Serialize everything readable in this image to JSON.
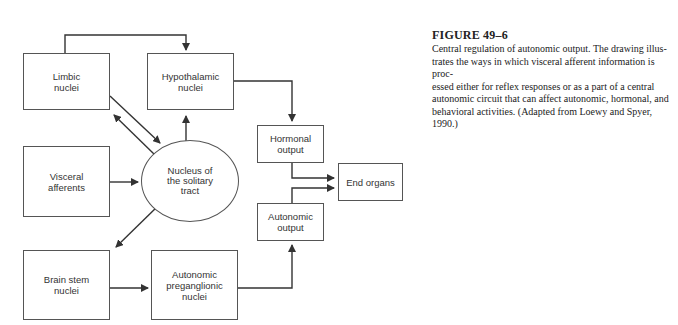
{
  "diagram": {
    "nodes": {
      "limbic": "Limbic nuclei",
      "hypothalamic": "Hypothalamic nuclei",
      "visceral": "Visceral afferents",
      "nts": "Nucleus of the solitary tract",
      "brainstem": "Brain stem nuclei",
      "preganglionic": "Autonomic preganglionic nuclei",
      "hormonal": "Hormonal output",
      "autonomic_output": "Autonomic output",
      "end_organs": "End organs"
    },
    "edges": [
      {
        "from": "Limbic nuclei",
        "to": "Hypothalamic nuclei"
      },
      {
        "from": "Limbic nuclei",
        "to": "Nucleus of the solitary tract"
      },
      {
        "from": "Nucleus of the solitary tract",
        "to": "Limbic nuclei"
      },
      {
        "from": "Nucleus of the solitary tract",
        "to": "Hypothalamic nuclei"
      },
      {
        "from": "Visceral afferents",
        "to": "Nucleus of the solitary tract"
      },
      {
        "from": "Nucleus of the solitary tract",
        "to": "Brain stem nuclei"
      },
      {
        "from": "Brain stem nuclei",
        "to": "Autonomic preganglionic nuclei"
      },
      {
        "from": "Autonomic preganglionic nuclei",
        "to": "Autonomic output"
      },
      {
        "from": "Hypothalamic nuclei",
        "to": "Hormonal output"
      },
      {
        "from": "Hormonal output",
        "to": "End organs"
      },
      {
        "from": "Autonomic output",
        "to": "End organs"
      }
    ]
  },
  "caption": {
    "title": "FIGURE 49–6",
    "lines": [
      "Central regulation of autonomic output. The drawing illus-",
      "trates the ways in which visceral afferent information is proc-",
      "essed either for reflex responses or as a part of a central",
      "autonomic circuit that can affect autonomic, hormonal, and",
      "behavioral activities. (Adapted from Loewy and Spyer, 1990.)"
    ]
  }
}
